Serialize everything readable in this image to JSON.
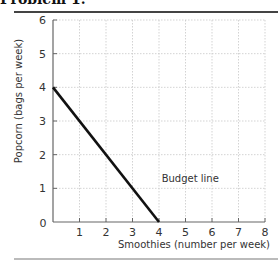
{
  "header": {
    "title": "Problem 1."
  },
  "chart_data": {
    "type": "line",
    "title": "",
    "xlabel": "Smoothies (number per week)",
    "ylabel": "Popcorn (bags per week)",
    "xlim": [
      0,
      8
    ],
    "ylim": [
      0,
      6
    ],
    "x_ticks": [
      0,
      1,
      2,
      3,
      4,
      5,
      6,
      7,
      8
    ],
    "y_ticks": [
      0,
      1,
      2,
      3,
      4,
      5,
      6
    ],
    "grid": true,
    "series": [
      {
        "name": "Budget line",
        "x": [
          0,
          4
        ],
        "y": [
          4,
          0
        ],
        "color": "#111111"
      }
    ],
    "annotations": [
      {
        "text": "Budget line",
        "x": 4.1,
        "y": 1.3
      }
    ]
  }
}
